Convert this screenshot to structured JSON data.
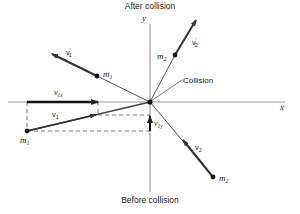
{
  "diagram": {
    "title_top": "After collision",
    "title_bottom": "Before collision",
    "axes": {
      "x_label": "x",
      "y_label": "y"
    },
    "collision_label": "Collision",
    "particles": {
      "m1_before": {
        "label": "m",
        "sub": "1"
      },
      "m2_before": {
        "label": "m",
        "sub": "2"
      },
      "m1_after": {
        "label": "m",
        "sub": "1"
      },
      "m2_after": {
        "label": "m",
        "sub": "2"
      }
    },
    "vectors": {
      "v1": {
        "label": "v",
        "sub": "1"
      },
      "v2": {
        "label": "v",
        "sub": "2"
      },
      "v1_prime": {
        "label": "v",
        "sup": "′",
        "sub": "1"
      },
      "v2_prime": {
        "label": "v",
        "sup": "′",
        "sub": "2"
      },
      "v1x": {
        "label": "v",
        "sub": "1x"
      },
      "v1y": {
        "label": "v",
        "sub": "1y"
      }
    },
    "colors": {
      "line": "#555555",
      "vector": "#333333",
      "dash": "#666666",
      "dot": "#111111"
    }
  }
}
